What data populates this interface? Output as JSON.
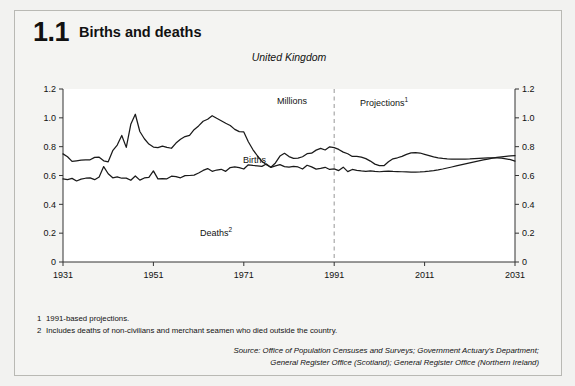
{
  "figure": {
    "number": "1.1",
    "title": "Births and deaths"
  },
  "chart_header": {
    "subtitle": "United Kingdom",
    "units_label": "Millions",
    "projections_label": "Projections",
    "projections_marker": "1"
  },
  "series_labels": {
    "births": "Births",
    "deaths": "Deaths",
    "deaths_marker": "2"
  },
  "footnotes": [
    {
      "num": "1",
      "text": "1991-based projections."
    },
    {
      "num": "2",
      "text": "Includes deaths of non-civilians and merchant seamen who died outside the country."
    }
  ],
  "source": [
    "Source: Office of Population Censuses and Surveys; Government Actuary's Department;",
    "General Register Office (Scotland); General Register Office (Northern Ireland)"
  ],
  "colors": {
    "line": "#1a1a1a",
    "axis": "#333333",
    "projection_divider": "#a8a8a8",
    "plot_background": "#ffffff",
    "page_background": "#f2f2f0"
  },
  "chart_data": {
    "type": "line",
    "title": "Births and deaths",
    "subtitle": "United Kingdom",
    "xlabel": "",
    "ylabel": "Millions",
    "xlim": [
      1931,
      2031
    ],
    "ylim": [
      0,
      1.2
    ],
    "xticks": [
      1931,
      1951,
      1971,
      1991,
      2011,
      2031
    ],
    "yticks": [
      0,
      0.2,
      0.4,
      0.6,
      0.8,
      1.0,
      1.2
    ],
    "grid": false,
    "dual_y_axis": true,
    "legend": "inline-annotations",
    "annotations": [
      {
        "text": "Millions",
        "x": 1982,
        "y": 1.14
      },
      {
        "text": "Projections1",
        "x": 1993,
        "y": 1.14
      },
      {
        "text": "Births",
        "x": 1974,
        "y": 0.95
      },
      {
        "text": "Deaths2",
        "x": 1962,
        "y": 0.545
      }
    ],
    "projection_start_year": 1991,
    "series": [
      {
        "name": "Births",
        "x": [
          1931,
          1932,
          1933,
          1934,
          1935,
          1936,
          1937,
          1938,
          1939,
          1940,
          1941,
          1942,
          1943,
          1944,
          1945,
          1946,
          1947,
          1948,
          1949,
          1950,
          1951,
          1952,
          1953,
          1954,
          1955,
          1956,
          1957,
          1958,
          1959,
          1960,
          1961,
          1962,
          1963,
          1964,
          1965,
          1966,
          1967,
          1968,
          1969,
          1970,
          1971,
          1972,
          1973,
          1974,
          1975,
          1976,
          1977,
          1978,
          1979,
          1980,
          1981,
          1982,
          1983,
          1984,
          1985,
          1986,
          1987,
          1988,
          1989,
          1990,
          1991,
          1992,
          1993,
          1994,
          1995,
          1996,
          1997,
          1998,
          1999,
          2000,
          2001,
          2002,
          2003,
          2004,
          2005,
          2006,
          2007,
          2008,
          2009,
          2010,
          2011,
          2012,
          2013,
          2014,
          2015,
          2016,
          2017,
          2018,
          2019,
          2020,
          2021,
          2022,
          2023,
          2024,
          2025,
          2026,
          2027,
          2028,
          2029,
          2030,
          2031
        ],
        "values": [
          0.75,
          0.73,
          0.698,
          0.702,
          0.706,
          0.708,
          0.709,
          0.726,
          0.727,
          0.702,
          0.695,
          0.772,
          0.811,
          0.878,
          0.795,
          0.955,
          1.025,
          0.905,
          0.855,
          0.818,
          0.797,
          0.793,
          0.804,
          0.795,
          0.789,
          0.825,
          0.851,
          0.87,
          0.879,
          0.918,
          0.944,
          0.976,
          0.99,
          1.015,
          0.997,
          0.98,
          0.962,
          0.947,
          0.92,
          0.904,
          0.902,
          0.834,
          0.78,
          0.737,
          0.698,
          0.675,
          0.657,
          0.687,
          0.735,
          0.754,
          0.731,
          0.719,
          0.721,
          0.73,
          0.751,
          0.755,
          0.776,
          0.788,
          0.777,
          0.799,
          0.793,
          0.781,
          0.762,
          0.751,
          0.732,
          0.733,
          0.727,
          0.717,
          0.7,
          0.679,
          0.669,
          0.668,
          0.695,
          0.716,
          0.723,
          0.733,
          0.747,
          0.757,
          0.758,
          0.756,
          0.747,
          0.738,
          0.729,
          0.723,
          0.719,
          0.716,
          0.714,
          0.713,
          0.713,
          0.714,
          0.715,
          0.717,
          0.719,
          0.721,
          0.722,
          0.723,
          0.722,
          0.72,
          0.716,
          0.71,
          0.7
        ]
      },
      {
        "name": "Deaths",
        "x": [
          1931,
          1932,
          1933,
          1934,
          1935,
          1936,
          1937,
          1938,
          1939,
          1940,
          1941,
          1942,
          1943,
          1944,
          1945,
          1946,
          1947,
          1948,
          1949,
          1950,
          1951,
          1952,
          1953,
          1954,
          1955,
          1956,
          1957,
          1958,
          1959,
          1960,
          1961,
          1962,
          1963,
          1964,
          1965,
          1966,
          1967,
          1968,
          1969,
          1970,
          1971,
          1972,
          1973,
          1974,
          1975,
          1976,
          1977,
          1978,
          1979,
          1980,
          1981,
          1982,
          1983,
          1984,
          1985,
          1986,
          1987,
          1988,
          1989,
          1990,
          1991,
          1992,
          1993,
          1994,
          1995,
          1996,
          1997,
          1998,
          1999,
          2000,
          2001,
          2002,
          2003,
          2004,
          2005,
          2006,
          2007,
          2008,
          2009,
          2010,
          2011,
          2012,
          2013,
          2014,
          2015,
          2016,
          2017,
          2018,
          2019,
          2020,
          2021,
          2022,
          2023,
          2024,
          2025,
          2026,
          2027,
          2028,
          2029,
          2030,
          2031
        ],
        "values": [
          0.577,
          0.572,
          0.58,
          0.562,
          0.575,
          0.581,
          0.584,
          0.571,
          0.59,
          0.662,
          0.612,
          0.584,
          0.59,
          0.581,
          0.582,
          0.567,
          0.597,
          0.568,
          0.583,
          0.587,
          0.632,
          0.577,
          0.578,
          0.577,
          0.595,
          0.592,
          0.584,
          0.599,
          0.6,
          0.603,
          0.617,
          0.635,
          0.648,
          0.629,
          0.638,
          0.643,
          0.629,
          0.655,
          0.66,
          0.655,
          0.645,
          0.674,
          0.67,
          0.667,
          0.663,
          0.68,
          0.656,
          0.667,
          0.675,
          0.662,
          0.658,
          0.663,
          0.659,
          0.645,
          0.671,
          0.66,
          0.644,
          0.649,
          0.657,
          0.642,
          0.646,
          0.634,
          0.658,
          0.627,
          0.642,
          0.636,
          0.632,
          0.629,
          0.632,
          0.628,
          0.626,
          0.628,
          0.63,
          0.628,
          0.627,
          0.626,
          0.625,
          0.624,
          0.624,
          0.625,
          0.627,
          0.63,
          0.634,
          0.639,
          0.645,
          0.652,
          0.659,
          0.666,
          0.673,
          0.68,
          0.687,
          0.694,
          0.701,
          0.708,
          0.714,
          0.72,
          0.725,
          0.729,
          0.733,
          0.736,
          0.738
        ]
      }
    ]
  }
}
